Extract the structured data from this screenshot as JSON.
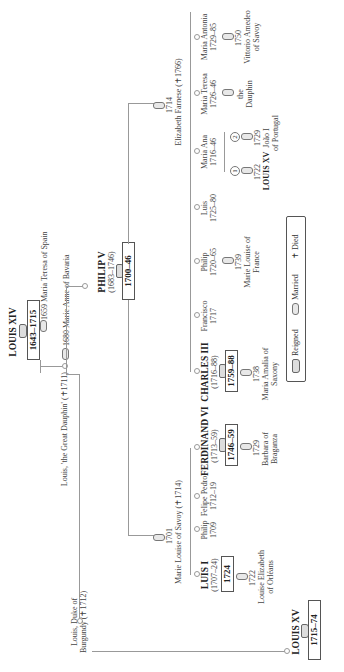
{
  "orientation": "rotated-90-ccw",
  "louis_xiv": {
    "name": "LOUIS XIV",
    "reign": "1643–1715",
    "marriage": "1659 Maria Teresa of Spain"
  },
  "great_dauphin": {
    "name": "Louis, 'the Great Dauphin' (✝1711)",
    "marriage": "1680 Marie Anne of Bavaria"
  },
  "duke_burgundy": {
    "name_line1": "Louis, Duke of",
    "name_line2": "Burgundy (✝1712)"
  },
  "louis_xv_main": {
    "name": "LOUIS XV",
    "reign": "1715–74"
  },
  "philip_v": {
    "name": "PHILIP V",
    "dates": "(1683–1746)",
    "reign": "1700–46",
    "marriage1": {
      "year": "1701",
      "spouse": "Marie Louise of Savoy (✝1714)"
    },
    "marriage2": {
      "year": "1714",
      "spouse": "Elizabeth Farnese (✝1766)"
    }
  },
  "children_first": [
    {
      "name": "LUIS I",
      "dates": "(1707–24)",
      "reign": "1724",
      "marriage_year": "1722",
      "spouse_line1": "Louise Elizabeth",
      "spouse_line2": "of Orléans"
    },
    {
      "name": "Philip",
      "dates": "1709"
    },
    {
      "name": "Felipe Pedro",
      "dates": "1712–19"
    },
    {
      "name": "FERDINAND VI",
      "dates": "(1713–59)",
      "reign": "1746–59",
      "marriage_year": "1729",
      "spouse_line1": "Barbara of",
      "spouse_line2": "Braganza"
    }
  ],
  "children_second": [
    {
      "name": "CHARLES III",
      "dates": "(1716–88)",
      "reign": "1759–88",
      "marriage_year": "1738",
      "spouse_line1": "Maria Amalia of",
      "spouse_line2": "Saxony"
    },
    {
      "name": "Francisco",
      "dates": "1717"
    },
    {
      "name": "Philip",
      "dates": "1720–65",
      "marriage_year": "1739",
      "spouse_line1": "Marie Louise of",
      "spouse_line2": "France"
    },
    {
      "name": "Luis",
      "dates": "1725–80"
    },
    {
      "name": "Maria Ana",
      "dates": "1716–46",
      "marriages": [
        {
          "num": "1",
          "year": "1722",
          "spouse": "LOUIS XV"
        },
        {
          "num": "2",
          "year": "1729",
          "spouse_line1": "João I",
          "spouse_line2": "of Portugal"
        }
      ]
    },
    {
      "name": "Maria Teresa",
      "dates": "1726–46",
      "spouse_line1": "the",
      "spouse_line2": "Dauphin"
    },
    {
      "name": "Maria Antonia",
      "dates": "1729–85",
      "marriage_year": "1750",
      "spouse_line1": "Vittorio Amedeo",
      "spouse_line2": "of Savoy"
    }
  ],
  "legend": {
    "reigned": "Reigned",
    "married": "Married",
    "died": "✝ Died"
  }
}
